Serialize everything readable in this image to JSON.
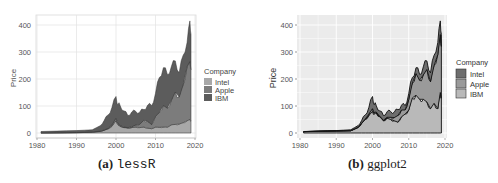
{
  "chart_data": [
    {
      "type": "area",
      "title": "",
      "caption_tag": "(a)",
      "caption_name": "lessR",
      "xlabel": "",
      "ylabel": "Price",
      "xlim": [
        1980,
        2020
      ],
      "ylim": [
        0,
        420
      ],
      "x_ticks": [
        "1980",
        "1990",
        "2000",
        "2010",
        "2020"
      ],
      "y_ticks": [
        "0",
        "100",
        "200",
        "300",
        "400"
      ],
      "grid": true,
      "stacked": true,
      "legend": {
        "title": "Company",
        "position": "right",
        "entries": [
          "Intel",
          "Apple",
          "IBM"
        ]
      },
      "x": [
        1981,
        1985,
        1990,
        1994,
        1996,
        1997,
        1998,
        1999,
        2000,
        2000.5,
        2001,
        2002,
        2003,
        2004,
        2005,
        2006,
        2007,
        2008,
        2009,
        2010,
        2011,
        2012,
        2013,
        2014,
        2015,
        2016,
        2017,
        2018,
        2018.7,
        2019
      ],
      "series": [
        {
          "name": "Intel",
          "color": "#a8a8a8",
          "values": [
            0.2,
            0.5,
            1,
            3,
            6,
            10,
            15,
            25,
            45,
            30,
            25,
            20,
            18,
            20,
            22,
            20,
            22,
            18,
            16,
            22,
            21,
            22,
            22,
            30,
            32,
            33,
            38,
            45,
            50,
            45
          ]
        },
        {
          "name": "Apple",
          "color": "#7c7c7c",
          "values": [
            0.3,
            0.5,
            1,
            1,
            1,
            1,
            2,
            5,
            10,
            5,
            3,
            2,
            2,
            3,
            8,
            12,
            25,
            25,
            15,
            40,
            55,
            80,
            70,
            90,
            120,
            100,
            140,
            200,
            215,
            190
          ]
        },
        {
          "name": "IBM",
          "color": "#5c5c5c",
          "values": [
            5,
            6,
            7,
            8,
            20,
            35,
            50,
            65,
            80,
            70,
            75,
            60,
            45,
            55,
            50,
            45,
            40,
            60,
            70,
            85,
            130,
            140,
            125,
            125,
            115,
            90,
            110,
            90,
            150,
            130
          ]
        }
      ],
      "total_peak": 415
    },
    {
      "type": "area",
      "title": "",
      "caption_tag": "(b)",
      "caption_name": "ggplot2",
      "xlabel": "",
      "ylabel": "Price",
      "xlim": [
        1980,
        2020
      ],
      "ylim": [
        0,
        420
      ],
      "x_ticks": [
        "1980",
        "1990",
        "2000",
        "2010",
        "2020"
      ],
      "y_ticks": [
        "0",
        "100",
        "200",
        "300",
        "400"
      ],
      "grid": true,
      "stacked": true,
      "legend": {
        "title": "Company",
        "position": "right",
        "entries": [
          "Intel",
          "Apple",
          "IBM"
        ]
      },
      "x": [
        1981,
        1985,
        1990,
        1994,
        1996,
        1997,
        1998,
        1999,
        2000,
        2000.5,
        2001,
        2002,
        2003,
        2004,
        2005,
        2006,
        2007,
        2008,
        2009,
        2010,
        2011,
        2012,
        2013,
        2014,
        2015,
        2016,
        2017,
        2018,
        2018.7,
        2019
      ],
      "series": [
        {
          "name": "Intel",
          "color": "#6e6e6e",
          "values": [
            0.2,
            0.5,
            1,
            3,
            6,
            10,
            15,
            25,
            45,
            30,
            25,
            20,
            18,
            20,
            22,
            20,
            22,
            18,
            16,
            22,
            21,
            22,
            22,
            30,
            32,
            33,
            38,
            45,
            50,
            45
          ]
        },
        {
          "name": "Apple",
          "color": "#9a9a9a",
          "values": [
            0.3,
            0.5,
            1,
            1,
            1,
            1,
            2,
            5,
            10,
            5,
            3,
            2,
            2,
            3,
            8,
            12,
            25,
            25,
            15,
            40,
            55,
            80,
            70,
            90,
            120,
            100,
            140,
            200,
            215,
            190
          ]
        },
        {
          "name": "IBM",
          "color": "#b9b9b9",
          "values": [
            5,
            6,
            7,
            8,
            20,
            35,
            50,
            65,
            80,
            70,
            75,
            60,
            45,
            55,
            50,
            45,
            40,
            60,
            70,
            85,
            130,
            140,
            125,
            125,
            115,
            90,
            110,
            90,
            150,
            130
          ]
        }
      ],
      "total_peak": 415
    }
  ],
  "panels": {
    "a": {
      "ylabel": "Price",
      "legend_title": "Company",
      "legend": [
        "Intel",
        "Apple",
        "IBM"
      ],
      "caption_tag": "(a)",
      "caption_name": "lessR",
      "x_ticks": [
        "1980",
        "1990",
        "2000",
        "2010",
        "2020"
      ],
      "y_ticks": [
        "0",
        "100",
        "200",
        "300",
        "400"
      ]
    },
    "b": {
      "ylabel": "Price",
      "legend_title": "Company",
      "legend": [
        "Intel",
        "Apple",
        "IBM"
      ],
      "caption_tag": "(b)",
      "caption_name": "ggplot2",
      "x_ticks": [
        "1980",
        "1990",
        "2000",
        "2010",
        "2020"
      ],
      "y_ticks": [
        "0",
        "100",
        "200",
        "300",
        "400"
      ]
    }
  }
}
